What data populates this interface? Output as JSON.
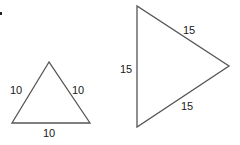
{
  "diagram": {
    "colors": {
      "stroke": "#555555",
      "text": "#1a1a1a"
    },
    "triangles": [
      {
        "name": "small-equilateral-triangle",
        "points": "49,62 12,123 90,123",
        "sides": {
          "left": "10",
          "right": "10",
          "bottom": "10"
        }
      },
      {
        "name": "large-equilateral-triangle",
        "points": "137,6 137,127 229,66",
        "sides": {
          "upper": "15",
          "left": "15",
          "lower": "15"
        }
      }
    ]
  }
}
